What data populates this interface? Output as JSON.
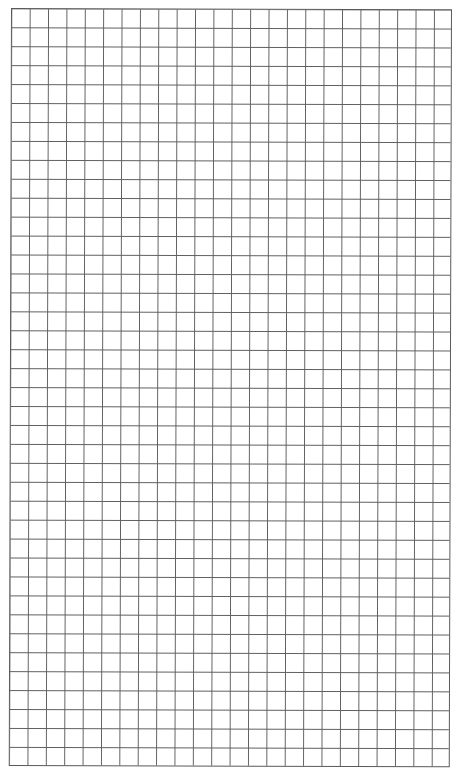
{
  "sheet": {
    "type": "graph-paper",
    "columns": 24,
    "rows": 40,
    "cell_width_px": 18.4,
    "cell_height_px": 18.95,
    "line_color": "#5f5f5f",
    "background_color": "#ffffff"
  }
}
